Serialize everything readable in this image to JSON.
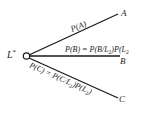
{
  "diagram": {
    "type": "probability-tree",
    "root": {
      "label": "L",
      "superscript": "*"
    },
    "branches": [
      {
        "target": "A",
        "edge_label": "P(A)"
      },
      {
        "target": "B",
        "edge_label_parts": [
          "P(B) = P(B/L",
          "2",
          ")P(L",
          "2"
        ]
      },
      {
        "target": "C",
        "edge_label_parts": [
          "P(C) = P(C/L",
          "2",
          ")P(L",
          "2",
          ")"
        ]
      }
    ]
  }
}
